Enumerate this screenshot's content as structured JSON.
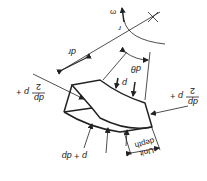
{
  "figure": {
    "rotation_deg": 180,
    "colors": {
      "ink": "#222222",
      "background": "#ffffff"
    },
    "labels": {
      "omega": "ω",
      "r": "r",
      "dr": "dr",
      "dtheta": "dθ",
      "p": "p",
      "p_plus_dp": "p + dp",
      "left_frac_prefix": "p +",
      "left_frac_num": "dp",
      "left_frac_den": "2",
      "right_frac_prefix": "p +",
      "right_frac_num": "dp",
      "right_frac_den": "2",
      "unit_line1": "Unit",
      "unit_line2": "depth"
    }
  }
}
